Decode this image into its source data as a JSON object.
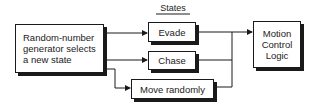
{
  "diagram": {
    "title": "States",
    "source_box": {
      "label": "Random-number\ngenerator selects\na new state"
    },
    "states": [
      {
        "label": "Evade"
      },
      {
        "label": "Chase"
      },
      {
        "label": "Move randomly"
      }
    ],
    "target_box": {
      "label": "Motion\nControl\nLogic"
    },
    "colors": {
      "line": "#1a1a1a",
      "box_fill": "#ffffff",
      "text": "#222222"
    }
  }
}
